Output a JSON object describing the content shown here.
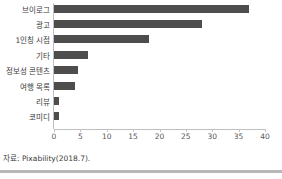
{
  "chart_data": {
    "type": "bar",
    "orientation": "horizontal",
    "title": "",
    "subtitle": "",
    "xlabel": "",
    "ylabel": "",
    "categories": [
      "브이로그",
      "광고",
      "1인칭 시점",
      "기타",
      "정보성 콘텐츠",
      "여행 목록",
      "리뷰",
      "코미디"
    ],
    "values": [
      37,
      28,
      18,
      6.5,
      4.5,
      4,
      1,
      1
    ],
    "series": [
      {
        "name": "",
        "values": [
          37,
          28,
          18,
          6.5,
          4.5,
          4,
          1,
          1
        ]
      }
    ],
    "xlim": [
      0,
      40
    ],
    "xticks": [
      0,
      5,
      10,
      15,
      20,
      25,
      30,
      35,
      40
    ],
    "xtick_labels": [
      "0",
      "5",
      "10",
      "15",
      "20",
      "25",
      "30",
      "35",
      "40"
    ],
    "grid": false,
    "legend": false,
    "legend_position": "none",
    "bar_color": "#4d4d4d",
    "axis_color": "#bfbfbf",
    "label_color": "#3c3c3c",
    "tick_label_color": "#595959",
    "background": "#ffffff"
  },
  "source_note": "자료: Pixability(2018.7).",
  "footer": {
    "rule_color": "#b8b8b8"
  }
}
